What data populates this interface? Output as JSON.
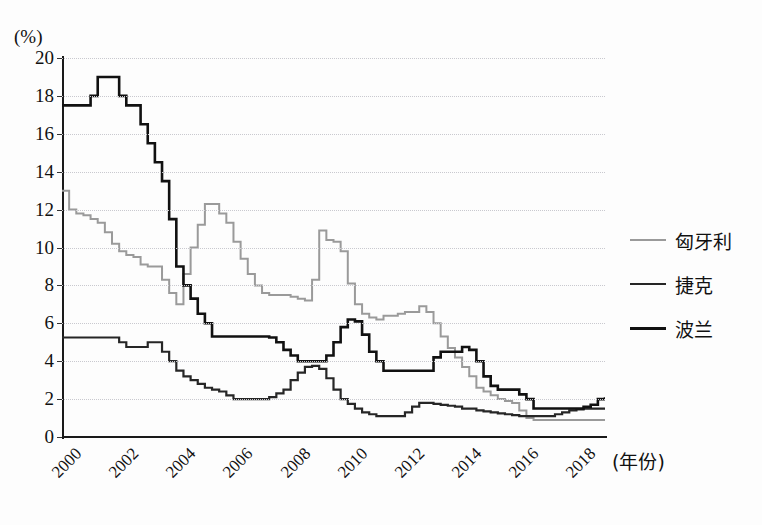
{
  "axes": {
    "y_unit_label": "(%)",
    "x_title": "(年份)",
    "y_ticks": [
      0,
      2,
      4,
      6,
      8,
      10,
      12,
      14,
      16,
      18,
      20
    ],
    "x_ticks": [
      "2000",
      "2002",
      "2004",
      "2006",
      "2008",
      "2010",
      "2012",
      "2014",
      "2016",
      "2018"
    ]
  },
  "legend": {
    "items": [
      {
        "label": "匈牙利",
        "color": "#9a9a9a"
      },
      {
        "label": "捷克",
        "color": "#262626"
      },
      {
        "label": "波兰",
        "color": "#111111"
      }
    ]
  },
  "chart_data": {
    "type": "line",
    "title": "",
    "xlabel": "(年份)",
    "ylabel": "(%)",
    "xlim": [
      2000,
      2019
    ],
    "ylim": [
      0,
      20
    ],
    "grid": true,
    "legend_position": "right",
    "x": [
      2000,
      2000.25,
      2000.5,
      2000.75,
      2001,
      2001.25,
      2001.5,
      2001.75,
      2002,
      2002.25,
      2002.5,
      2002.75,
      2003,
      2003.25,
      2003.5,
      2003.75,
      2004,
      2004.25,
      2004.5,
      2004.75,
      2005,
      2005.25,
      2005.5,
      2005.75,
      2006,
      2006.25,
      2006.5,
      2006.75,
      2007,
      2007.25,
      2007.5,
      2007.75,
      2008,
      2008.25,
      2008.5,
      2008.75,
      2009,
      2009.25,
      2009.5,
      2009.75,
      2010,
      2010.25,
      2010.5,
      2010.75,
      2011,
      2011.25,
      2011.5,
      2011.75,
      2012,
      2012.25,
      2012.5,
      2012.75,
      2013,
      2013.25,
      2013.5,
      2013.75,
      2014,
      2014.25,
      2014.5,
      2014.75,
      2015,
      2015.25,
      2015.5,
      2015.75,
      2016,
      2016.25,
      2016.5,
      2016.75,
      2017,
      2017.25,
      2017.5,
      2017.75,
      2018,
      2018.25,
      2018.5,
      2018.75,
      2019
    ],
    "series": [
      {
        "name": "匈牙利",
        "color": "#9a9a9a",
        "width": 2.0,
        "values": [
          13.0,
          12.0,
          11.8,
          11.7,
          11.5,
          11.3,
          10.8,
          10.2,
          9.8,
          9.6,
          9.5,
          9.1,
          9.0,
          9.0,
          8.3,
          7.6,
          7.0,
          8.6,
          10.0,
          11.2,
          12.3,
          12.3,
          11.8,
          11.3,
          10.3,
          9.4,
          8.6,
          8.0,
          7.6,
          7.5,
          7.5,
          7.5,
          7.4,
          7.3,
          7.2,
          8.3,
          10.9,
          10.4,
          10.3,
          9.8,
          8.1,
          7.0,
          6.5,
          6.3,
          6.2,
          6.4,
          6.4,
          6.5,
          6.6,
          6.6,
          6.9,
          6.6,
          6.0,
          5.3,
          4.7,
          4.2,
          3.7,
          3.2,
          2.6,
          2.4,
          2.2,
          2.0,
          1.9,
          1.8,
          1.4,
          1.0,
          0.9,
          0.9,
          0.9,
          0.9,
          0.9,
          0.9,
          0.9,
          0.9,
          0.9,
          0.9,
          0.9
        ]
      },
      {
        "name": "捷克",
        "color": "#262626",
        "width": 2.2,
        "values": [
          5.25,
          5.25,
          5.25,
          5.25,
          5.25,
          5.25,
          5.25,
          5.25,
          5.0,
          4.75,
          4.75,
          4.75,
          5.0,
          5.0,
          4.5,
          4.0,
          3.5,
          3.2,
          3.0,
          2.8,
          2.6,
          2.5,
          2.4,
          2.2,
          2.0,
          2.0,
          2.0,
          2.0,
          2.0,
          2.1,
          2.3,
          2.5,
          3.0,
          3.4,
          3.7,
          3.75,
          3.6,
          3.1,
          2.5,
          2.0,
          1.75,
          1.5,
          1.3,
          1.2,
          1.1,
          1.1,
          1.1,
          1.1,
          1.3,
          1.6,
          1.8,
          1.8,
          1.75,
          1.7,
          1.65,
          1.6,
          1.5,
          1.5,
          1.4,
          1.35,
          1.3,
          1.25,
          1.2,
          1.15,
          1.1,
          1.1,
          1.1,
          1.1,
          1.1,
          1.2,
          1.3,
          1.4,
          1.45,
          1.5,
          1.5,
          1.5,
          1.5
        ]
      },
      {
        "name": "波兰",
        "color": "#111111",
        "width": 2.6,
        "values": [
          17.5,
          17.5,
          17.5,
          17.5,
          18.0,
          19.0,
          19.0,
          19.0,
          18.0,
          17.5,
          17.5,
          16.5,
          15.5,
          14.5,
          13.5,
          11.5,
          9.0,
          8.0,
          7.3,
          6.5,
          6.0,
          5.3,
          5.3,
          5.3,
          5.3,
          5.3,
          5.3,
          5.3,
          5.3,
          5.25,
          5.0,
          4.6,
          4.3,
          4.0,
          4.0,
          4.0,
          4.0,
          4.3,
          5.0,
          5.8,
          6.2,
          6.1,
          5.4,
          4.5,
          4.0,
          3.5,
          3.5,
          3.5,
          3.5,
          3.5,
          3.5,
          3.5,
          4.2,
          4.5,
          4.5,
          4.5,
          4.75,
          4.6,
          4.0,
          3.2,
          2.7,
          2.5,
          2.5,
          2.5,
          2.25,
          2.0,
          1.5,
          1.5,
          1.5,
          1.5,
          1.5,
          1.5,
          1.5,
          1.6,
          1.7,
          2.0,
          2.1
        ]
      }
    ]
  }
}
